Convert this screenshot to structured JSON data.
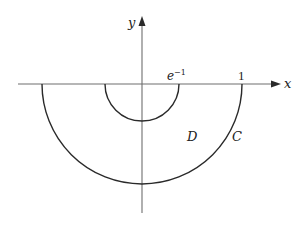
{
  "figure": {
    "type": "region-diagram",
    "axes": {
      "x_label": "x",
      "y_label": "y"
    },
    "tick_labels": {
      "inner_radius": "e",
      "inner_radius_exp": "−1",
      "outer_radius": "1"
    },
    "region_label": "D",
    "curve_label": "C",
    "inner_radius_value": 0.3679,
    "outer_radius_value": 1
  },
  "colors": {
    "axis": "#6e6e6e",
    "curve": "#2a2a2a",
    "text": "#222222",
    "background": "#ffffff"
  }
}
